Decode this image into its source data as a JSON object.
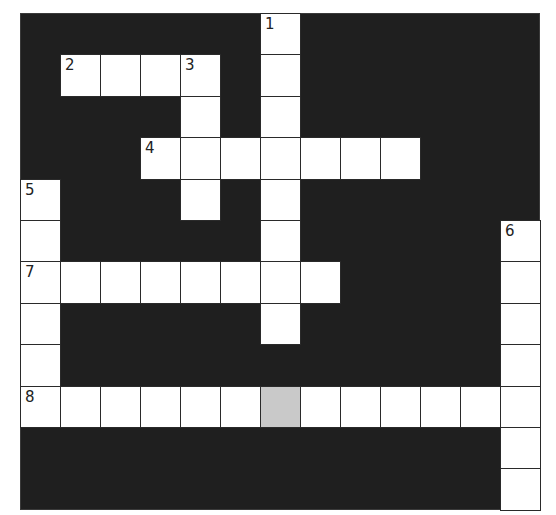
{
  "puzzle": {
    "type": "crossword",
    "cols": 13,
    "rows": 12,
    "colors": {
      "block": "#1f1f1f",
      "cell": "#ffffff",
      "shaded": "#c9c9c9",
      "line": "#2a2a2a"
    },
    "layout": "0=block,1=white,2=shaded",
    "grid": [
      [
        0,
        0,
        0,
        0,
        0,
        0,
        1,
        0,
        0,
        0,
        0,
        0,
        0
      ],
      [
        0,
        1,
        1,
        1,
        1,
        0,
        1,
        0,
        0,
        0,
        0,
        0,
        0
      ],
      [
        0,
        0,
        0,
        0,
        1,
        0,
        1,
        0,
        0,
        0,
        0,
        0,
        0
      ],
      [
        0,
        0,
        0,
        1,
        1,
        1,
        1,
        1,
        1,
        1,
        0,
        0,
        0
      ],
      [
        1,
        0,
        0,
        0,
        1,
        0,
        1,
        0,
        0,
        0,
        0,
        0,
        0
      ],
      [
        1,
        0,
        0,
        0,
        0,
        0,
        1,
        0,
        0,
        0,
        0,
        0,
        1
      ],
      [
        1,
        1,
        1,
        1,
        1,
        1,
        1,
        1,
        0,
        0,
        0,
        0,
        1
      ],
      [
        1,
        0,
        0,
        0,
        0,
        0,
        1,
        0,
        0,
        0,
        0,
        0,
        1
      ],
      [
        1,
        0,
        0,
        0,
        0,
        0,
        0,
        0,
        0,
        0,
        0,
        0,
        1
      ],
      [
        1,
        1,
        1,
        1,
        1,
        1,
        2,
        1,
        1,
        1,
        1,
        1,
        1
      ],
      [
        0,
        0,
        0,
        0,
        0,
        0,
        0,
        0,
        0,
        0,
        0,
        0,
        1
      ],
      [
        0,
        0,
        0,
        0,
        0,
        0,
        0,
        0,
        0,
        0,
        0,
        0,
        1
      ]
    ],
    "numbers": [
      {
        "label": "1",
        "row": 0,
        "col": 6
      },
      {
        "label": "2",
        "row": 1,
        "col": 1
      },
      {
        "label": "3",
        "row": 1,
        "col": 4
      },
      {
        "label": "4",
        "row": 3,
        "col": 3
      },
      {
        "label": "5",
        "row": 4,
        "col": 0
      },
      {
        "label": "6",
        "row": 5,
        "col": 12
      },
      {
        "label": "7",
        "row": 6,
        "col": 0
      },
      {
        "label": "8",
        "row": 9,
        "col": 0
      }
    ],
    "entries": [
      {
        "number": "1",
        "direction": "down",
        "length": 8
      },
      {
        "number": "2",
        "direction": "across",
        "length": 4
      },
      {
        "number": "3",
        "direction": "down",
        "length": 4
      },
      {
        "number": "4",
        "direction": "across",
        "length": 7
      },
      {
        "number": "5",
        "direction": "down",
        "length": 6
      },
      {
        "number": "6",
        "direction": "down",
        "length": 7
      },
      {
        "number": "7",
        "direction": "across",
        "length": 8
      },
      {
        "number": "8",
        "direction": "across",
        "length": 13
      }
    ]
  }
}
